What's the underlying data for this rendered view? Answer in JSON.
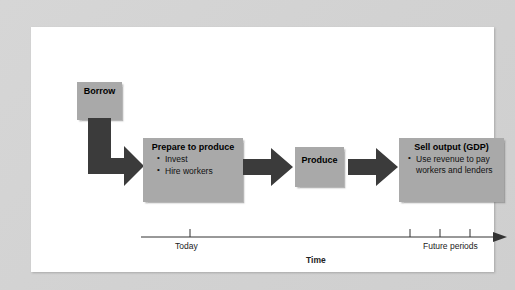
{
  "figure": {
    "background_color": "#d4d4d4",
    "panel_color": "#ffffff",
    "box_fill_color": "#a9a9a9",
    "arrow_color": "#3b3b3b"
  },
  "nodes": [
    {
      "id": "borrow",
      "title": "Borrow",
      "bullets": []
    },
    {
      "id": "prepare",
      "title": "Prepare to produce",
      "bullets": [
        "Invest",
        "Hire workers"
      ]
    },
    {
      "id": "produce",
      "title": "Produce",
      "bullets": []
    },
    {
      "id": "sell",
      "title": "Sell output (GDP)",
      "bullets": [
        "Use revenue to pay workers and lenders"
      ]
    }
  ],
  "timeline": {
    "axis_label": "Time",
    "today_label": "Today",
    "future_label": "Future periods",
    "tick_count_future": 3
  }
}
